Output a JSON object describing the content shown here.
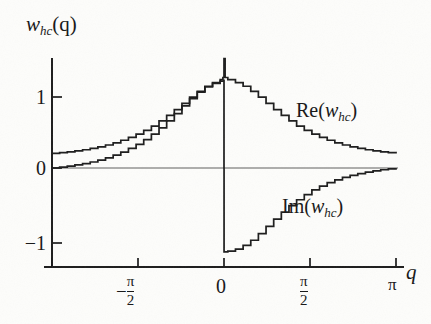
{
  "figure": {
    "background_color": "#fdfdfb",
    "ink_color": "#1a1a1a"
  },
  "axis": {
    "y_label_main": "w",
    "y_label_sub": "hc",
    "y_label_arg": "(q)",
    "x_label": "q",
    "y_ticks": [
      "1",
      "0",
      "−1"
    ],
    "x_ticks": [
      "−π/2",
      "0",
      "π/2",
      "π"
    ],
    "x_tick_minus": "−",
    "x_tick_pi_num": "π",
    "x_tick_two_den": "2",
    "x_tick_zero": "0",
    "x_tick_pi": "π"
  },
  "labels": {
    "re": {
      "fn": "Re(",
      "var": "w",
      "sub": "hc",
      "close": ")"
    },
    "im": {
      "fn": "Im(",
      "var": "w",
      "sub": "hc",
      "close": ")"
    }
  },
  "chart_data": {
    "type": "line",
    "title": "",
    "subtitle": "",
    "xlabel": "q",
    "ylabel": "w_hc(q)",
    "xlim": [
      -3.14159,
      3.14159
    ],
    "ylim": [
      -1.35,
      1.55
    ],
    "grid": false,
    "legend_position": "inline-annotation",
    "x_tick_values": [
      -3.14159,
      -1.5708,
      0,
      1.5708,
      3.14159
    ],
    "x_tick_labels": [
      "",
      "−π/2",
      "0",
      "π/2",
      "π"
    ],
    "y_tick_values": [
      1,
      0,
      -1
    ],
    "y_tick_labels": [
      "1",
      "0",
      "−1"
    ],
    "note": "Staircase-quantized real and imaginary parts of a half-cycle window transform; Re is even with a narrow spike at q=0, Im is odd with a discontinuity at q=0.",
    "series": [
      {
        "name": "Re(w_hc)",
        "style": "staircase",
        "x": [
          -3.14159,
          -3.00197,
          -2.86234,
          -2.72271,
          -2.58309,
          -2.44346,
          -2.30383,
          -2.16421,
          -2.02458,
          -1.88496,
          -1.74533,
          -1.6057,
          -1.46608,
          -1.32645,
          -1.18682,
          -1.0472,
          -0.90757,
          -0.76794,
          -0.62832,
          -0.48869,
          -0.34907,
          -0.20944,
          -0.06981,
          -0.02,
          0.0,
          0.02,
          0.06981,
          0.20944,
          0.34907,
          0.48869,
          0.62832,
          0.76794,
          0.90757,
          1.0472,
          1.18682,
          1.32645,
          1.46608,
          1.6057,
          1.74533,
          1.88496,
          2.02458,
          2.16421,
          2.30383,
          2.44346,
          2.58309,
          2.72271,
          2.86234,
          3.00197,
          3.14159
        ],
        "y": [
          0.2,
          0.21,
          0.22,
          0.235,
          0.25,
          0.27,
          0.29,
          0.315,
          0.345,
          0.38,
          0.42,
          0.465,
          0.515,
          0.575,
          0.645,
          0.72,
          0.8,
          0.885,
          0.97,
          1.05,
          1.12,
          1.17,
          1.21,
          1.24,
          1.5,
          1.24,
          1.21,
          1.17,
          1.12,
          1.05,
          0.97,
          0.885,
          0.8,
          0.72,
          0.645,
          0.575,
          0.515,
          0.465,
          0.42,
          0.38,
          0.345,
          0.315,
          0.29,
          0.27,
          0.25,
          0.235,
          0.22,
          0.21,
          0.2
        ]
      },
      {
        "name": "Im(w_hc)",
        "style": "staircase",
        "x": [
          -3.14159,
          -3.00197,
          -2.86234,
          -2.72271,
          -2.58309,
          -2.44346,
          -2.30383,
          -2.16421,
          -2.02458,
          -1.88496,
          -1.74533,
          -1.6057,
          -1.46608,
          -1.32645,
          -1.18682,
          -1.0472,
          -0.90757,
          -0.76794,
          -0.62832,
          -0.48869,
          -0.34907,
          -0.20944,
          -0.06981,
          -0.001,
          0.0,
          0.001,
          0.06981,
          0.20944,
          0.34907,
          0.48869,
          0.62832,
          0.76794,
          0.90757,
          1.0472,
          1.18682,
          1.32645,
          1.46608,
          1.6057,
          1.74533,
          1.88496,
          2.02458,
          2.16421,
          2.30383,
          2.44346,
          2.58309,
          2.72271,
          2.86234,
          3.00197,
          3.14159
        ],
        "y": [
          0.0,
          0.012,
          0.026,
          0.042,
          0.06,
          0.082,
          0.108,
          0.138,
          0.175,
          0.218,
          0.268,
          0.325,
          0.39,
          0.465,
          0.55,
          0.645,
          0.745,
          0.85,
          0.95,
          1.04,
          1.11,
          1.16,
          1.19,
          1.2,
          0.0,
          -1.15,
          -1.14,
          -1.11,
          -1.06,
          -0.99,
          -0.9,
          -0.8,
          -0.7,
          -0.605,
          -0.515,
          -0.435,
          -0.365,
          -0.3,
          -0.248,
          -0.2,
          -0.162,
          -0.128,
          -0.1,
          -0.076,
          -0.056,
          -0.039,
          -0.024,
          -0.011,
          0.0
        ]
      }
    ]
  }
}
